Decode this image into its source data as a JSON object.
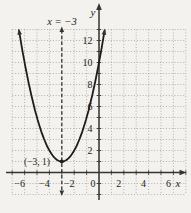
{
  "figure": {
    "axis_x_label": "x",
    "axis_y_label": "y",
    "line_label": "x = −3",
    "vertex_label": "(−3, 1)"
  },
  "chart_data": {
    "type": "line",
    "title": "",
    "function": "y = (x + 3)^2 + 1",
    "vertex": {
      "x": -3,
      "y": 1
    },
    "axis_of_symmetry": "x = −3",
    "dashed_vertical_line_x": -3,
    "curve_x_range": [
      -6.45,
      0.45
    ],
    "x_tick_labels": [
      -6,
      -4,
      -2,
      0,
      2,
      4,
      6
    ],
    "y_tick_labels": [
      2,
      4,
      6,
      8,
      10,
      12
    ],
    "xlim": [
      -7,
      7
    ],
    "ylim": [
      -2,
      13
    ],
    "grid": true,
    "grid_step": 1,
    "colors": {
      "background": "#f3f2ee",
      "grid": "#98968f",
      "axis": "#35342f",
      "dashed_line": "#35342f",
      "curve": "#1e1d1b",
      "text": "#1e1d1b"
    }
  }
}
